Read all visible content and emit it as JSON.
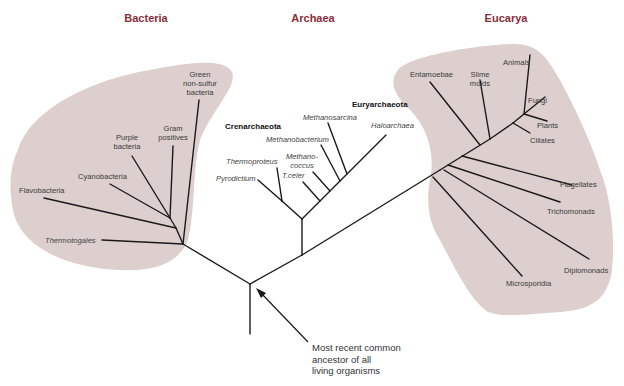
{
  "domains": {
    "bacteria": "Bacteria",
    "archaea": "Archaea",
    "eucarya": "Eucarya"
  },
  "colors": {
    "domain_heading": "#8b2e3a",
    "region_fill": "#dccfce",
    "line": "#1a1a1a"
  },
  "bacteria": {
    "green_nonsulfur": [
      "Green",
      "non-sulfur",
      "bacteria"
    ],
    "gram_positives": [
      "Gram",
      "positives"
    ],
    "purple_bacteria": [
      "Purple",
      "bacteria"
    ],
    "cyanobacteria": "Cyanobacteria",
    "flavobacteria": "Flavobacteria",
    "thermotogales": "Thermotogales"
  },
  "archaea": {
    "crenarchaeota": "Crenarchaeota",
    "euryarchaeota": "Euryarchaeota",
    "methanosarcina": "Methanosarcina",
    "methanobacterium": "Methanobacterium",
    "haloarchaea": "Haloarchaea",
    "methanococcus": [
      "Methano-",
      "coccus"
    ],
    "thermoproteus": "Thermoproteus",
    "t_celer": "T.celer",
    "pyrodictium": "Pyrodictium"
  },
  "eucarya": {
    "entamoebae": "Entamoebae",
    "slime_molds": [
      "Slime",
      "molds"
    ],
    "animals": "Animals",
    "fungi": "Fungi",
    "plants": "Plants",
    "ciliates": "Ciliates",
    "flagellates": "Flagellates",
    "trichomonads": "Trichomonads",
    "diplomonads": "Diplomonads",
    "microsporidia": "Microsporidia"
  },
  "annotation": {
    "lines": [
      "Most recent common",
      "ancestor of all",
      "living organisms"
    ]
  }
}
